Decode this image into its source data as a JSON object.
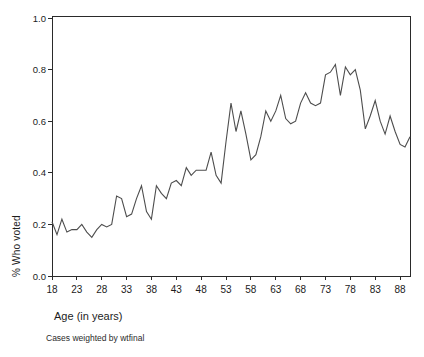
{
  "chart_data": {
    "type": "line",
    "title": "",
    "xlabel": "Age (in years)",
    "ylabel": "% Who voted",
    "footnote": "Cases weighted by wtfinal",
    "series_name": "proportion who voted by age",
    "grid": false,
    "legend": "none",
    "xlim": [
      18,
      90
    ],
    "ylim": [
      0.0,
      1.0
    ],
    "x_ticks": [
      18,
      23,
      28,
      33,
      38,
      43,
      48,
      53,
      58,
      63,
      68,
      73,
      78,
      83,
      88
    ],
    "y_ticks": [
      0.0,
      0.2,
      0.4,
      0.6,
      0.8,
      1.0
    ],
    "y_tick_labels": [
      "0.0",
      "0.2",
      "0.4",
      "0.6",
      "0.8",
      "1.0"
    ],
    "line_color": "#4d4d4d",
    "frame_color": "#2a2a2a",
    "x": [
      18,
      19,
      20,
      21,
      22,
      23,
      24,
      25,
      26,
      27,
      28,
      29,
      30,
      31,
      32,
      33,
      34,
      35,
      36,
      37,
      38,
      39,
      40,
      41,
      42,
      43,
      44,
      45,
      46,
      47,
      48,
      49,
      50,
      51,
      52,
      53,
      54,
      55,
      56,
      57,
      58,
      59,
      60,
      61,
      62,
      63,
      64,
      65,
      66,
      67,
      68,
      69,
      70,
      71,
      72,
      73,
      74,
      75,
      76,
      77,
      78,
      79,
      80,
      81,
      82,
      83,
      84,
      85,
      86,
      87,
      88,
      89,
      90
    ],
    "y": [
      0.21,
      0.16,
      0.22,
      0.17,
      0.18,
      0.18,
      0.2,
      0.17,
      0.15,
      0.18,
      0.2,
      0.19,
      0.2,
      0.31,
      0.3,
      0.23,
      0.24,
      0.3,
      0.35,
      0.25,
      0.22,
      0.35,
      0.32,
      0.3,
      0.36,
      0.37,
      0.35,
      0.42,
      0.39,
      0.41,
      0.41,
      0.41,
      0.48,
      0.39,
      0.36,
      0.52,
      0.67,
      0.56,
      0.64,
      0.55,
      0.45,
      0.47,
      0.54,
      0.64,
      0.6,
      0.64,
      0.7,
      0.61,
      0.59,
      0.6,
      0.67,
      0.71,
      0.67,
      0.66,
      0.67,
      0.78,
      0.79,
      0.82,
      0.7,
      0.81,
      0.78,
      0.8,
      0.72,
      0.57,
      0.62,
      0.68,
      0.6,
      0.55,
      0.62,
      0.56,
      0.51,
      0.5,
      0.54
    ]
  }
}
